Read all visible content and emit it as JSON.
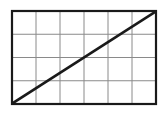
{
  "canvas": {
    "width": 167,
    "height": 126,
    "background_color": "#ffffff"
  },
  "figure": {
    "title": "",
    "plot_area": {
      "x": 12,
      "y": 11,
      "width": 144,
      "height": 93
    },
    "border": {
      "color": "#1a1a1a",
      "width": 2.2,
      "style": "solid"
    },
    "grid": {
      "columns": 6,
      "rows": 4,
      "line_color": "#8a8a8a",
      "line_width": 1,
      "vertical_line_x": [
        36,
        60,
        84,
        108,
        132
      ],
      "horizontal_line_y": [
        34.25,
        57.5,
        80.75
      ]
    }
  },
  "chart_data": {
    "type": "line",
    "title": "",
    "xlabel": "",
    "ylabel": "",
    "xlim": [
      0,
      6
    ],
    "ylim": [
      0,
      4
    ],
    "xticks": [
      0,
      1,
      2,
      3,
      4,
      5,
      6
    ],
    "yticks": [
      0,
      1,
      2,
      3,
      4
    ],
    "xticklabels": [
      "",
      "",
      "",
      "",
      "",
      "",
      ""
    ],
    "yticklabels": [
      "",
      "",
      "",
      "",
      ""
    ],
    "grid": true,
    "legend": null,
    "series": [
      {
        "name": "diagonal",
        "type": "line",
        "color": "#1a1a1a",
        "line_width": 2.5,
        "x": [
          0,
          6
        ],
        "y": [
          0,
          4
        ]
      }
    ],
    "annotations": []
  }
}
